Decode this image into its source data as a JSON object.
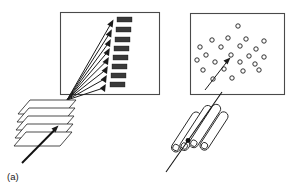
{
  "figure": {
    "caption_label": "(a)",
    "colors": {
      "panel_border": "#4a4a4a",
      "ink": "#1a1a1a",
      "band_fill": "#3a3a3a",
      "background": "#ffffff",
      "spot_stroke": "#1c1c1c"
    },
    "left_panel": {
      "name": "array-readout-panel",
      "x": 60,
      "y": 12,
      "width": 100,
      "height": 83,
      "convergence_point": {
        "x": 67,
        "y": 100
      },
      "arrow_count": 8,
      "arrows": [
        {
          "x2": 113,
          "y2": 21
        },
        {
          "x2": 111,
          "y2": 31
        },
        {
          "x2": 110,
          "y2": 41
        },
        {
          "x2": 109,
          "y2": 50
        },
        {
          "x2": 108,
          "y2": 59
        },
        {
          "x2": 107,
          "y2": 68
        },
        {
          "x2": 106,
          "y2": 77
        },
        {
          "x2": 105,
          "y2": 86
        }
      ],
      "band_count": 8,
      "bands": [
        {
          "x": 117,
          "y": 17,
          "w": 15,
          "h": 5
        },
        {
          "x": 116,
          "y": 27,
          "w": 15,
          "h": 5
        },
        {
          "x": 115,
          "y": 37,
          "w": 15,
          "h": 5
        },
        {
          "x": 114,
          "y": 46,
          "w": 15,
          "h": 5
        },
        {
          "x": 113,
          "y": 55,
          "w": 15,
          "h": 5
        },
        {
          "x": 112,
          "y": 64,
          "w": 15,
          "h": 5
        },
        {
          "x": 111,
          "y": 73,
          "w": 15,
          "h": 5
        },
        {
          "x": 110,
          "y": 82,
          "w": 15,
          "h": 5
        }
      ]
    },
    "slide_stack": {
      "name": "stacked-slides",
      "sheet_count": 5,
      "sheets": [
        {
          "top_left_x": 30,
          "top_y": 100
        },
        {
          "top_left_x": 29,
          "top_y": 108
        },
        {
          "top_left_x": 28,
          "top_y": 116
        },
        {
          "top_left_x": 27,
          "top_y": 124
        },
        {
          "top_left_x": 26,
          "top_y": 132
        }
      ],
      "sheet_width": 46,
      "sheet_skew": 18,
      "sheet_height": 14
    },
    "caption_pointer": {
      "name": "caption-leader-arrow",
      "from": {
        "x": 22,
        "y": 163
      },
      "to": {
        "x": 58,
        "y": 126
      }
    },
    "right_panel": {
      "name": "spot-array-panel",
      "x": 190,
      "y": 13,
      "width": 95,
      "height": 82,
      "spot_count": 23,
      "spot_radius": 2.2,
      "spots": [
        {
          "x": 238,
          "y": 26
        },
        {
          "x": 212,
          "y": 40
        },
        {
          "x": 228,
          "y": 38
        },
        {
          "x": 246,
          "y": 39
        },
        {
          "x": 264,
          "y": 41
        },
        {
          "x": 200,
          "y": 47
        },
        {
          "x": 221,
          "y": 47
        },
        {
          "x": 240,
          "y": 46
        },
        {
          "x": 256,
          "y": 49
        },
        {
          "x": 206,
          "y": 55
        },
        {
          "x": 231,
          "y": 55
        },
        {
          "x": 249,
          "y": 56
        },
        {
          "x": 264,
          "y": 57
        },
        {
          "x": 197,
          "y": 60
        },
        {
          "x": 215,
          "y": 62
        },
        {
          "x": 240,
          "y": 62
        },
        {
          "x": 255,
          "y": 64
        },
        {
          "x": 203,
          "y": 70
        },
        {
          "x": 224,
          "y": 69
        },
        {
          "x": 243,
          "y": 71
        },
        {
          "x": 259,
          "y": 70
        },
        {
          "x": 232,
          "y": 78
        },
        {
          "x": 213,
          "y": 79
        }
      ],
      "inner_arrow": {
        "from_x": 205,
        "from_y": 90,
        "to_x": 230,
        "to_y": 58
      }
    },
    "tube_bundle": {
      "name": "capillary-tube-bundle",
      "tube_count": 4,
      "tubes": [
        {
          "cx": 186,
          "cy": 132,
          "length": 46,
          "width": 9,
          "angle": -57
        },
        {
          "cx": 196,
          "cy": 128,
          "length": 52,
          "width": 9,
          "angle": -57
        },
        {
          "cx": 205,
          "cy": 126,
          "length": 50,
          "width": 9,
          "angle": -57
        },
        {
          "cx": 214,
          "cy": 131,
          "length": 44,
          "width": 9,
          "angle": -57
        }
      ],
      "through_line": {
        "x1": 166,
        "y1": 172,
        "x2": 222,
        "y2": 92
      }
    }
  }
}
